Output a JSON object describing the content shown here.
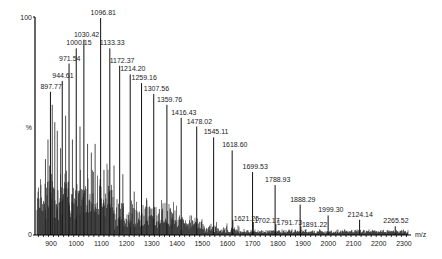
{
  "chart_data": {
    "type": "bar",
    "title": "",
    "subtitle": "",
    "xlabel": "m/z",
    "ylabel": "%",
    "xlim": [
      835,
      2330
    ],
    "ylim": [
      0,
      100
    ],
    "x_ticks": [
      900,
      1000,
      1100,
      1200,
      1300,
      1400,
      1500,
      1600,
      1700,
      1800,
      1900,
      2000,
      2100,
      2200,
      2300
    ],
    "y_ticks": [
      {
        "value": 0,
        "label": "0"
      },
      {
        "value": 50,
        "label": "%"
      },
      {
        "value": 100,
        "label": "100"
      }
    ],
    "grid": false,
    "legend": null,
    "peaks": [
      {
        "mz": 897.77,
        "intensity": 66,
        "label": "897.77"
      },
      {
        "mz": 944.61,
        "intensity": 71,
        "label": "944.61"
      },
      {
        "mz": 971.54,
        "intensity": 79,
        "label": "971.54"
      },
      {
        "mz": 1000.15,
        "intensity": 86,
        "label": "1000.15"
      },
      {
        "mz": 1030.42,
        "intensity": 90,
        "label": "1030.42"
      },
      {
        "mz": 1096.81,
        "intensity": 100,
        "label": "1096.81"
      },
      {
        "mz": 1133.33,
        "intensity": 86,
        "label": "1133.33"
      },
      {
        "mz": 1172.37,
        "intensity": 78,
        "label": "1172.37"
      },
      {
        "mz": 1214.2,
        "intensity": 74,
        "label": "1214.20"
      },
      {
        "mz": 1259.16,
        "intensity": 70,
        "label": "1259.16"
      },
      {
        "mz": 1307.56,
        "intensity": 65,
        "label": "1307.56"
      },
      {
        "mz": 1359.76,
        "intensity": 60,
        "label": "1359.76"
      },
      {
        "mz": 1416.43,
        "intensity": 54,
        "label": "1416.43"
      },
      {
        "mz": 1478.02,
        "intensity": 50,
        "label": "1478.02"
      },
      {
        "mz": 1545.11,
        "intensity": 45,
        "label": "1545.11"
      },
      {
        "mz": 1618.6,
        "intensity": 39,
        "label": "1618.60"
      },
      {
        "mz": 1621.25,
        "intensity": 7,
        "label": "1621.25"
      },
      {
        "mz": 1699.53,
        "intensity": 29,
        "label": "1699.53"
      },
      {
        "mz": 1702.17,
        "intensity": 6,
        "label": "1702.17"
      },
      {
        "mz": 1788.93,
        "intensity": 23,
        "label": "1788.93"
      },
      {
        "mz": 1791.73,
        "intensity": 5,
        "label": "1791.73"
      },
      {
        "mz": 1888.29,
        "intensity": 14,
        "label": "1888.29"
      },
      {
        "mz": 1891.22,
        "intensity": 4,
        "label": "1891.22"
      },
      {
        "mz": 1999.3,
        "intensity": 9,
        "label": "1999.30"
      },
      {
        "mz": 2124.14,
        "intensity": 7,
        "label": "2124.14"
      },
      {
        "mz": 2265.52,
        "intensity": 4,
        "label": "2265.52"
      }
    ],
    "x": [
      897.77,
      944.61,
      971.54,
      1000.15,
      1030.42,
      1096.81,
      1133.33,
      1172.37,
      1214.2,
      1259.16,
      1307.56,
      1359.76,
      1416.43,
      1478.02,
      1545.11,
      1618.6,
      1621.25,
      1699.53,
      1702.17,
      1788.93,
      1791.73,
      1888.29,
      1891.22,
      1999.3,
      2124.14,
      2265.52
    ],
    "values": [
      66,
      71,
      79,
      86,
      90,
      100,
      86,
      78,
      74,
      70,
      65,
      60,
      54,
      50,
      45,
      39,
      7,
      29,
      6,
      23,
      5,
      14,
      4,
      9,
      7,
      4
    ],
    "annotations": "Labeled peak m/z values; dense noisy baseline (~5-25%) from 850 to 1600 m/z"
  }
}
